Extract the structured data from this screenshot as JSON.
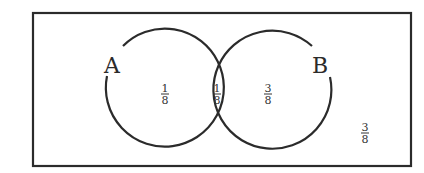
{
  "diagram": {
    "type": "venn",
    "universe": {
      "label": "",
      "region_outside": {
        "numerator": "3",
        "denominator": "8",
        "value": "3/8"
      }
    },
    "sets": [
      {
        "id": "A",
        "label": "A"
      },
      {
        "id": "B",
        "label": "B"
      }
    ],
    "regions": {
      "A_only": {
        "numerator": "1",
        "denominator": "8",
        "value": "1/8"
      },
      "A_and_B": {
        "numerator": "1",
        "denominator": "8",
        "value": "1/8"
      },
      "B_only": {
        "numerator": "3",
        "denominator": "8",
        "value": "3/8"
      },
      "neither": {
        "numerator": "3",
        "denominator": "8",
        "value": "3/8"
      }
    },
    "colors": {
      "stroke": "#2b2b2b",
      "background": "#ffffff"
    }
  }
}
